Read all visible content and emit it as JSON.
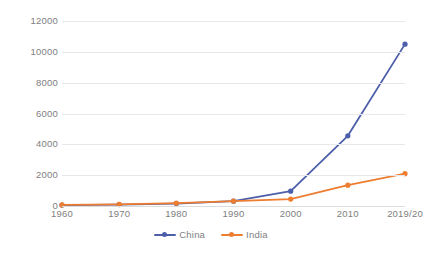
{
  "chart_data": {
    "type": "line",
    "title": "",
    "subtitle": "",
    "xlabel": "",
    "ylabel": "",
    "categories": [
      "1960",
      "1970",
      "1980",
      "1990",
      "2000",
      "2010",
      "2019/20"
    ],
    "series": [
      {
        "name": "China",
        "color": "#4d5fab",
        "values": [
          60,
          90,
          160,
          310,
          960,
          4550,
          10500
        ]
      },
      {
        "name": "India",
        "color": "#ed7d31",
        "values": [
          70,
          110,
          180,
          320,
          450,
          1350,
          2100
        ]
      }
    ],
    "ylim": [
      0,
      12000
    ],
    "yticks": [
      0,
      2000,
      4000,
      6000,
      8000,
      10000,
      12000
    ],
    "ytick_labels": [
      "0",
      "2000",
      "4000",
      "6000",
      "8000",
      "10000",
      "12000"
    ],
    "grid": true,
    "grid_axis": "y",
    "legend_position": "bottom",
    "markers": true
  },
  "legend": {
    "items": [
      {
        "label": "China",
        "color": "#4d5fab"
      },
      {
        "label": "India",
        "color": "#ed7d31"
      }
    ]
  },
  "colors": {
    "china": "#4d5fab",
    "india": "#ed7d31",
    "gridline": "#e8e8e8",
    "axis_text": "#808080",
    "background": "#ffffff"
  }
}
